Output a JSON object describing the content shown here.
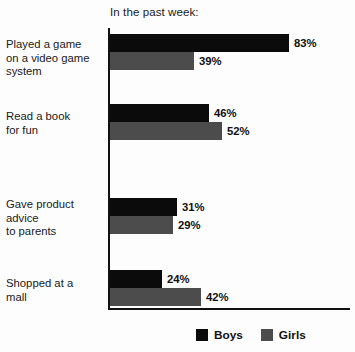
{
  "chart_data": {
    "type": "bar",
    "orientation": "horizontal",
    "title": "In the past week:",
    "xlabel": "",
    "ylabel": "",
    "xlim": [
      0,
      100
    ],
    "grid": false,
    "legend_position": "bottom-right",
    "value_suffix": "%",
    "categories": [
      "Played a game on a video game system",
      "Read a book for fun",
      "Gave product advice to parents",
      "Shopped at a mall"
    ],
    "category_lines": [
      [
        "Played a game",
        "on a video game",
        "system"
      ],
      [
        "Read a book",
        "for fun"
      ],
      [
        "Gave product",
        "advice",
        "to parents"
      ],
      [
        "Shopped at a",
        "mall"
      ]
    ],
    "series": [
      {
        "name": "Boys",
        "color": "#0b0b0b",
        "values": [
          83,
          46,
          31,
          24
        ],
        "labels": [
          "83%",
          "46%",
          "31%",
          "24%"
        ]
      },
      {
        "name": "Girls",
        "color": "#4c4c4c",
        "values": [
          39,
          52,
          29,
          42
        ],
        "labels": [
          "39%",
          "52%",
          "29%",
          "42%"
        ]
      }
    ]
  },
  "legend": {
    "items": [
      {
        "label": "Boys",
        "color": "#0b0b0b"
      },
      {
        "label": "Girls",
        "color": "#4c4c4c"
      }
    ]
  }
}
